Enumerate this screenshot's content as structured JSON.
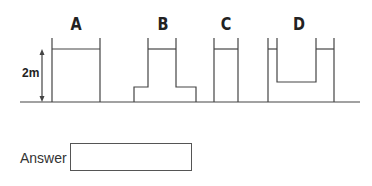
{
  "diagram": {
    "containers": [
      {
        "label": "A",
        "shape": "straight tank"
      },
      {
        "label": "B",
        "shape": "narrow neck on wide stepped base"
      },
      {
        "label": "C",
        "shape": "narrow straight tank"
      },
      {
        "label": "D",
        "shape": "U-shaped tank"
      }
    ],
    "height_label": "2m",
    "line_color": "#444444"
  },
  "answer": {
    "label": "Answer",
    "value": ""
  }
}
